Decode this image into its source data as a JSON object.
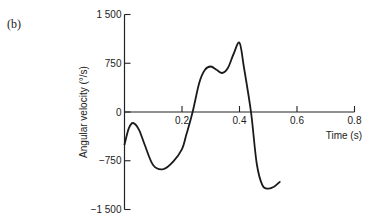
{
  "panel_label": "(b)",
  "chart_data": {
    "type": "line",
    "title": "",
    "xlabel": "Time (s)",
    "ylabel": "Angular velocity (°/s)",
    "xlim": [
      0,
      0.8
    ],
    "ylim": [
      -1500,
      1500
    ],
    "grid": false,
    "legend": null,
    "x_ticks": [
      {
        "value": 0.2,
        "label": "0.2"
      },
      {
        "value": 0.4,
        "label": "0.4"
      },
      {
        "value": 0.6,
        "label": "0.6"
      },
      {
        "value": 0.8,
        "label": "0.8"
      }
    ],
    "y_ticks": [
      {
        "value": 1500,
        "label": "1 500"
      },
      {
        "value": 750,
        "label": "750"
      },
      {
        "value": 0,
        "label": "0"
      },
      {
        "value": -750,
        "label": "−750"
      },
      {
        "value": -1500,
        "label": "−1 500"
      }
    ],
    "series": [
      {
        "name": "angular velocity",
        "x": [
          0.0,
          0.015,
          0.03,
          0.05,
          0.07,
          0.1,
          0.135,
          0.17,
          0.2,
          0.215,
          0.237,
          0.26,
          0.28,
          0.3,
          0.32,
          0.34,
          0.36,
          0.38,
          0.4,
          0.415,
          0.44,
          0.46,
          0.48,
          0.5,
          0.52,
          0.54
        ],
        "values": [
          -500,
          -250,
          -170,
          -270,
          -500,
          -820,
          -880,
          -760,
          -570,
          -350,
          0,
          450,
          650,
          700,
          650,
          600,
          680,
          900,
          1065,
          700,
          0,
          -800,
          -1130,
          -1180,
          -1150,
          -1075
        ]
      }
    ]
  }
}
